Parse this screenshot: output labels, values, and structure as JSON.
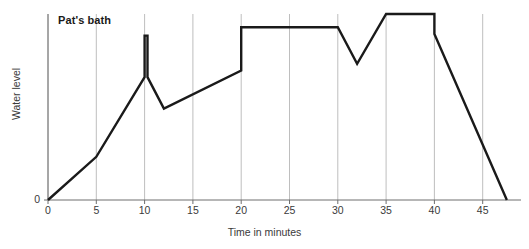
{
  "chart_data": {
    "type": "line",
    "title": "Pat's bath",
    "xlabel": "Time in minutes",
    "ylabel": "Water level",
    "xlim": [
      0,
      48.5
    ],
    "ylim": [
      0,
      112
    ],
    "grid": "vertical",
    "legend": "none",
    "xticks": [
      0,
      5,
      10,
      15,
      20,
      25,
      30,
      35,
      40,
      45
    ],
    "xtick_labels": [
      "0",
      "5",
      "10",
      "15",
      "20",
      "25",
      "30",
      "35",
      "40",
      "45"
    ],
    "yticks": [
      0
    ],
    "ytick_labels": [
      "0"
    ],
    "series": [
      {
        "name": "Water level",
        "x": [
          0,
          5,
          10,
          10,
          10.3,
          10.3,
          12,
          20,
          20,
          30,
          32,
          35,
          40,
          40,
          47.5
        ],
        "y": [
          0,
          26,
          74,
          99,
          99,
          74,
          55,
          78,
          104,
          104,
          82,
          112,
          112,
          100,
          0
        ],
        "points": [
          {
            "t": 0,
            "level": 0,
            "note": "tap on, bath empty"
          },
          {
            "t": 5,
            "level": 26,
            "note": "filling slowly"
          },
          {
            "t": 10,
            "level": 74,
            "note": "filling faster"
          },
          {
            "t": 10,
            "level": 99,
            "note": "spike up - Pat gets in"
          },
          {
            "t": 10.3,
            "level": 99,
            "note": "top of spike"
          },
          {
            "t": 10.3,
            "level": 74,
            "note": "spike drops back"
          },
          {
            "t": 12,
            "level": 55,
            "note": "water drains / settles low"
          },
          {
            "t": 20,
            "level": 78,
            "note": "refilling gradually"
          },
          {
            "t": 20,
            "level": 104,
            "note": "step up"
          },
          {
            "t": 30,
            "level": 104,
            "note": "level holds steady"
          },
          {
            "t": 32,
            "level": 82,
            "note": "dip - water let out"
          },
          {
            "t": 35,
            "level": 112,
            "note": "topped up to highest level"
          },
          {
            "t": 40,
            "level": 112,
            "note": "holds at highest level"
          },
          {
            "t": 40,
            "level": 100,
            "note": "plug pulled, small drop"
          },
          {
            "t": 47.5,
            "level": 0,
            "note": "bath empty"
          }
        ]
      }
    ]
  },
  "style": {
    "line_color": "#1a1a1a",
    "grid_color": "#b7b7b7",
    "axis_color": "#6e6e6e",
    "text_color": "#3a3a3a",
    "title_color": "#1a1a1a",
    "background": "#ffffff"
  }
}
